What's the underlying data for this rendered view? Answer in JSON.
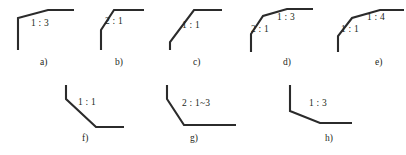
{
  "sheet": {
    "title": "Slope ratio figure set",
    "stroke_color": "#2b2b2b",
    "text_color": "#231f20",
    "background_color": "#ffffff",
    "width": 406,
    "height": 155
  },
  "figures": [
    {
      "id": "a",
      "caption": "a)",
      "caption_x": 40,
      "caption_y": 58,
      "origin_x": 10,
      "origin_y": 6,
      "points": "8,44 8,12 38,4 64,4",
      "labels": [
        {
          "text": "1 : 3",
          "x": 31,
          "y": 19
        }
      ]
    },
    {
      "id": "b",
      "caption": "b)",
      "caption_x": 115,
      "caption_y": 58,
      "origin_x": 96,
      "origin_y": 6,
      "points": "5,44 5,24 18,4 48,4",
      "labels": [
        {
          "text": "2 : 1",
          "x": 105,
          "y": 17
        }
      ]
    },
    {
      "id": "c",
      "caption": "c)",
      "caption_x": 193,
      "caption_y": 58,
      "origin_x": 168,
      "origin_y": 6,
      "points": "2,44 2,36 26,4 54,4",
      "labels": [
        {
          "text": "1 : 1",
          "x": 182,
          "y": 21
        }
      ]
    },
    {
      "id": "d",
      "caption": "d)",
      "caption_x": 283,
      "caption_y": 58,
      "origin_x": 243,
      "origin_y": 6,
      "points": "8,46 8,28 20,10 44,3 70,3",
      "labels": [
        {
          "text": "1 : 3",
          "x": 277,
          "y": 13
        },
        {
          "text": "2 : 1",
          "x": 251,
          "y": 25
        }
      ]
    },
    {
      "id": "e",
      "caption": "e)",
      "caption_x": 375,
      "caption_y": 58,
      "origin_x": 330,
      "origin_y": 6,
      "points": "8,46 8,30 22,12 50,4 74,4",
      "labels": [
        {
          "text": "1 : 4",
          "x": 367,
          "y": 13
        },
        {
          "text": "1 : 1",
          "x": 341,
          "y": 25
        }
      ]
    },
    {
      "id": "f",
      "caption": "f)",
      "caption_x": 82,
      "caption_y": 134,
      "origin_x": 60,
      "origin_y": 83,
      "points": "6,2 6,16 36,44 64,44",
      "labels": [
        {
          "text": "1 : 1",
          "x": 78,
          "y": 98
        }
      ]
    },
    {
      "id": "g",
      "caption": "g)",
      "caption_x": 190,
      "caption_y": 134,
      "origin_x": 162,
      "origin_y": 83,
      "points": "5,2 5,16 22,42 74,42",
      "labels": [
        {
          "text": "2 : 1~3",
          "x": 182,
          "y": 99
        }
      ]
    },
    {
      "id": "h",
      "caption": "h)",
      "caption_x": 325,
      "caption_y": 134,
      "origin_x": 286,
      "origin_y": 83,
      "points": "4,2 4,28 34,40 66,40",
      "labels": [
        {
          "text": "1 : 3",
          "x": 309,
          "y": 99
        }
      ]
    }
  ]
}
